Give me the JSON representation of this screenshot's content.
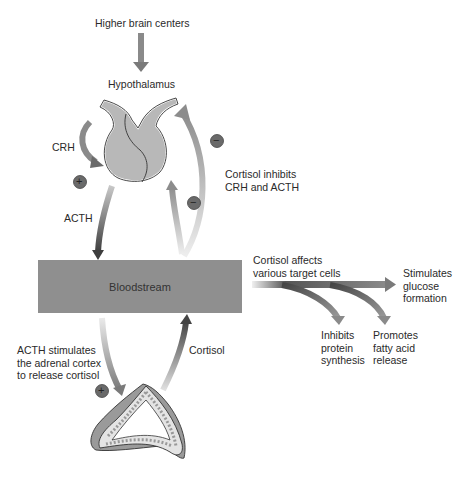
{
  "labels": {
    "higher_brain_centers": "Higher brain centers",
    "hypothalamus": "Hypothalamus",
    "crh": "CRH",
    "acth": "ACTH",
    "cortisol_inhibits": "Cortisol inhibits\nCRH and ACTH",
    "bloodstream": "Bloodstream",
    "cortisol_affects": "Cortisol affects\nvarious target cells",
    "stimulates_glucose": "Stimulates\nglucose\nformation",
    "inhibits_protein": "Inhibits\nprotein\nsynthesis",
    "promotes_fatty": "Promotes\nfatty acid\nrelease",
    "acth_stimulates": "ACTH stimulates\nthe adrenal cortex\nto release cortisol",
    "cortisol": "Cortisol"
  },
  "signs": {
    "plus": "+",
    "minus": "−"
  },
  "colors": {
    "arrow_dark": "#555555",
    "arrow_light": "#a8a8a8",
    "bloodstream": "#8f8f8f",
    "gland": "#b5b5b5",
    "badge": "#6a6a6a"
  }
}
